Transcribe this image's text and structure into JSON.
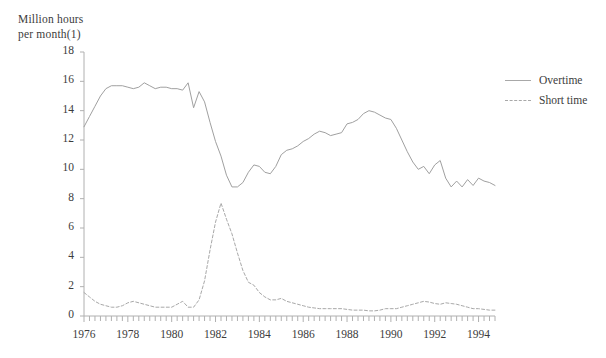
{
  "chart_data": {
    "type": "line",
    "title": "",
    "ylabel": "Million hours per month(1)",
    "ylabel_lines": [
      "Million hours",
      "per month(1)"
    ],
    "xlabel": "",
    "ylim": [
      0,
      18
    ],
    "yticks": [
      0,
      2,
      4,
      6,
      8,
      10,
      12,
      14,
      16,
      18
    ],
    "xlim": [
      1976,
      1994.75
    ],
    "xticks": [
      1976,
      1978,
      1980,
      1982,
      1984,
      1986,
      1988,
      1990,
      1992,
      1994
    ],
    "xtick_labels": [
      "1976",
      "1978",
      "1980",
      "1982",
      "1984",
      "1986",
      "1988",
      "1990",
      "1992",
      "1994"
    ],
    "minor_tick_interval": 0.25,
    "grid": false,
    "legend_position": "right",
    "x": [
      1976,
      1976.25,
      1976.5,
      1976.75,
      1977,
      1977.25,
      1977.5,
      1977.75,
      1978,
      1978.25,
      1978.5,
      1978.75,
      1979,
      1979.25,
      1979.5,
      1979.75,
      1980,
      1980.25,
      1980.5,
      1980.75,
      1981,
      1981.25,
      1981.5,
      1981.75,
      1982,
      1982.25,
      1982.5,
      1982.75,
      1983,
      1983.25,
      1983.5,
      1983.75,
      1984,
      1984.25,
      1984.5,
      1984.75,
      1985,
      1985.25,
      1985.5,
      1985.75,
      1986,
      1986.25,
      1986.5,
      1986.75,
      1987,
      1987.25,
      1987.5,
      1987.75,
      1988,
      1988.25,
      1988.5,
      1988.75,
      1989,
      1989.25,
      1989.5,
      1989.75,
      1990,
      1990.25,
      1990.5,
      1990.75,
      1991,
      1991.25,
      1991.5,
      1991.75,
      1992,
      1992.25,
      1992.5,
      1992.75,
      1993,
      1993.25,
      1993.5,
      1993.75,
      1994,
      1994.25,
      1994.5,
      1994.75
    ],
    "series": [
      {
        "name": "Overtime",
        "style": "solid",
        "color": "#a0a0a0",
        "values": [
          12.9,
          13.6,
          14.3,
          15.0,
          15.5,
          15.7,
          15.7,
          15.7,
          15.6,
          15.5,
          15.6,
          15.9,
          15.7,
          15.5,
          15.6,
          15.6,
          15.5,
          15.5,
          15.4,
          15.9,
          14.2,
          15.3,
          14.6,
          13.2,
          11.9,
          10.9,
          9.6,
          8.8,
          8.8,
          9.1,
          9.8,
          10.3,
          10.2,
          9.8,
          9.7,
          10.2,
          11.0,
          11.3,
          11.4,
          11.6,
          11.9,
          12.1,
          12.4,
          12.6,
          12.5,
          12.3,
          12.4,
          12.5,
          13.1,
          13.2,
          13.4,
          13.8,
          14.0,
          13.9,
          13.7,
          13.5,
          13.4,
          12.8,
          12.0,
          11.2,
          10.5,
          10.0,
          10.2,
          9.7,
          10.3,
          10.6,
          9.4,
          8.8,
          9.2,
          8.8,
          9.3,
          8.9,
          9.4,
          9.2,
          9.1,
          8.9
        ]
      },
      {
        "name": "Short time",
        "style": "dashed",
        "color": "#a8a8a8",
        "values": [
          1.6,
          1.3,
          1.0,
          0.8,
          0.7,
          0.6,
          0.6,
          0.7,
          0.9,
          1.0,
          0.9,
          0.8,
          0.7,
          0.6,
          0.6,
          0.6,
          0.6,
          0.8,
          1.0,
          0.6,
          0.6,
          1.1,
          2.4,
          4.5,
          6.4,
          7.7,
          6.6,
          5.6,
          4.3,
          3.1,
          2.3,
          2.1,
          1.6,
          1.3,
          1.1,
          1.1,
          1.2,
          1.0,
          0.9,
          0.8,
          0.7,
          0.6,
          0.55,
          0.5,
          0.5,
          0.5,
          0.5,
          0.5,
          0.45,
          0.4,
          0.4,
          0.4,
          0.35,
          0.35,
          0.4,
          0.5,
          0.5,
          0.5,
          0.6,
          0.7,
          0.8,
          0.9,
          1.0,
          0.95,
          0.85,
          0.8,
          0.9,
          0.85,
          0.8,
          0.7,
          0.6,
          0.5,
          0.5,
          0.45,
          0.4,
          0.4
        ]
      }
    ]
  },
  "legend": {
    "items": [
      {
        "label": "Overtime",
        "style": "solid"
      },
      {
        "label": "Short time",
        "style": "dashed"
      }
    ]
  }
}
